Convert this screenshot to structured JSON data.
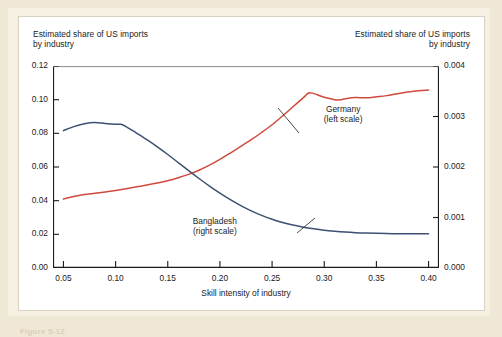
{
  "figure": {
    "left_axis_title": "Estimated share of US imports\nby industry",
    "right_axis_title": "Estimated share of US imports\nby industry",
    "xlabel": "Skill intensity of industry",
    "caption": "Figure 5-12"
  },
  "annotations": {
    "germany": "Germany\n(left scale)",
    "bangladesh": "Bangladesh\n(right scale)"
  },
  "colors": {
    "germany_line": "#cf4a3c",
    "bangladesh_line": "#3d4f72",
    "axis": "#1b1b1b",
    "panel": "#ffffff",
    "page_background": "#f0e8d6"
  },
  "chart_data": {
    "type": "line",
    "title": "Estimated share of US imports by industry",
    "xlabel": "Skill intensity of industry",
    "ylabel": "Estimated share of US imports by industry",
    "xlim": [
      0.04,
      0.41
    ],
    "xticks": [
      0.05,
      0.1,
      0.15,
      0.2,
      0.25,
      0.3,
      0.35,
      0.4
    ],
    "xticklabels": [
      "0.05",
      "0.10",
      "0.15",
      "0.20",
      "0.25",
      "0.30",
      "0.35",
      "0.40"
    ],
    "grid": false,
    "legend": "inline-annotations",
    "axes": [
      {
        "id": "left",
        "position": "left",
        "label": "Estimated share of US imports by industry",
        "ylim": [
          0.0,
          0.12
        ],
        "yticks": [
          0.0,
          0.02,
          0.04,
          0.06,
          0.08,
          0.1,
          0.12
        ],
        "yticklabels": [
          "0.00",
          "0.02",
          "0.04",
          "0.06",
          "0.08",
          "0.10",
          "0.12"
        ]
      },
      {
        "id": "right",
        "position": "right",
        "label": "Estimated share of US imports by industry",
        "ylim": [
          0.0,
          0.004
        ],
        "yticks": [
          0.0,
          0.001,
          0.002,
          0.003,
          0.004
        ],
        "yticklabels": [
          "0.000",
          "0.001",
          "0.002",
          "0.003",
          "0.004"
        ]
      }
    ],
    "series": [
      {
        "name": "Germany",
        "axis": "left",
        "scale_note": "left scale",
        "color": "#cf4a3c",
        "x": [
          0.05,
          0.06,
          0.07,
          0.08,
          0.09,
          0.1,
          0.11,
          0.12,
          0.13,
          0.14,
          0.15,
          0.16,
          0.17,
          0.18,
          0.19,
          0.2,
          0.21,
          0.22,
          0.23,
          0.24,
          0.25,
          0.26,
          0.27,
          0.28,
          0.285,
          0.29,
          0.3,
          0.31,
          0.315,
          0.32,
          0.33,
          0.34,
          0.35,
          0.36,
          0.37,
          0.38,
          0.39,
          0.4
        ],
        "values": [
          0.041,
          0.0425,
          0.0436,
          0.0444,
          0.0452,
          0.0461,
          0.0471,
          0.0482,
          0.0493,
          0.0505,
          0.0518,
          0.0536,
          0.0556,
          0.0581,
          0.0611,
          0.0645,
          0.0683,
          0.0722,
          0.0762,
          0.0805,
          0.0851,
          0.0903,
          0.0958,
          0.1012,
          0.104,
          0.1036,
          0.1014,
          0.1,
          0.0999,
          0.1005,
          0.1013,
          0.1011,
          0.1017,
          0.1024,
          0.1035,
          0.1045,
          0.1053,
          0.1057
        ]
      },
      {
        "name": "Bangladesh",
        "axis": "right",
        "scale_note": "right scale",
        "color": "#3d4f72",
        "x": [
          0.05,
          0.06,
          0.07,
          0.08,
          0.09,
          0.1,
          0.105,
          0.11,
          0.12,
          0.13,
          0.14,
          0.15,
          0.16,
          0.17,
          0.18,
          0.19,
          0.2,
          0.21,
          0.22,
          0.23,
          0.24,
          0.25,
          0.26,
          0.27,
          0.28,
          0.29,
          0.3,
          0.31,
          0.32,
          0.33,
          0.34,
          0.35,
          0.36,
          0.37,
          0.38,
          0.39,
          0.4
        ],
        "values": [
          0.00272,
          0.0028,
          0.002855,
          0.00288,
          0.002862,
          0.002848,
          0.002845,
          0.0028,
          0.002672,
          0.00254,
          0.002398,
          0.002248,
          0.002088,
          0.001928,
          0.001772,
          0.001622,
          0.001482,
          0.001352,
          0.001235,
          0.001132,
          0.001042,
          0.000966,
          0.000902,
          0.00085,
          0.000808,
          0.000775,
          0.000748,
          0.000728,
          0.000712,
          0.0007,
          0.000692,
          0.000686,
          0.000682,
          0.000679,
          0.000677,
          0.000676,
          0.000676
        ]
      }
    ]
  }
}
